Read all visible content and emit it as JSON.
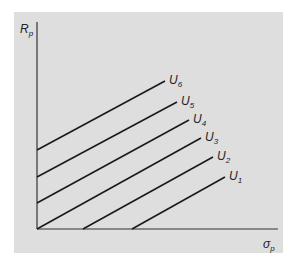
{
  "diagram": {
    "type": "indifference-curves",
    "y_axis_label": "R",
    "y_axis_subscript": "p",
    "x_axis_label": "σ",
    "x_axis_subscript": "p",
    "curves": [
      {
        "name": "U",
        "sub": "1",
        "x1": 132,
        "y1": 229,
        "x2": 225,
        "y2": 177
      },
      {
        "name": "U",
        "sub": "2",
        "x1": 83,
        "y1": 229,
        "x2": 213,
        "y2": 157
      },
      {
        "name": "U",
        "sub": "3",
        "x1": 37,
        "y1": 229,
        "x2": 201,
        "y2": 138
      },
      {
        "name": "U",
        "sub": "4",
        "x1": 37,
        "y1": 203,
        "x2": 189,
        "y2": 120
      },
      {
        "name": "U",
        "sub": "5",
        "x1": 37,
        "y1": 177,
        "x2": 177,
        "y2": 102
      },
      {
        "name": "U",
        "sub": "6",
        "x1": 37,
        "y1": 150,
        "x2": 165,
        "y2": 81
      }
    ],
    "colors": {
      "panel": "#dedede",
      "line": "#1a1a1a",
      "axis": "#333333"
    }
  }
}
